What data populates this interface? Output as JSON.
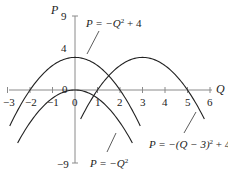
{
  "chart_data": {
    "type": "line",
    "title": "",
    "xlabel": "Q",
    "ylabel": "P",
    "xlim": [
      -3,
      6
    ],
    "ylim": [
      -9,
      9
    ],
    "x_ticks": [
      "-3",
      "-2",
      "-1",
      "0",
      "1",
      "2",
      "3",
      "4",
      "5",
      "6"
    ],
    "y_ticks": [
      "9",
      "4",
      "0",
      "-9"
    ],
    "grid": false,
    "legend": "none (curves labeled directly with annotations)",
    "series": [
      {
        "name": "P = -Q^2 + 4",
        "x": [
          -3,
          -2,
          -1,
          0,
          1,
          2,
          3
        ],
        "values": [
          -5,
          0,
          3,
          4,
          3,
          0,
          -5
        ]
      },
      {
        "name": "P = -Q^2",
        "x": [
          -3,
          -2,
          -1,
          0,
          1,
          2,
          3
        ],
        "values": [
          -9,
          -4,
          -1,
          0,
          -1,
          -4,
          -9
        ]
      },
      {
        "name": "P = -(Q - 3)^2 + 4",
        "x": [
          0,
          1,
          2,
          3,
          4,
          5,
          6
        ],
        "values": [
          -5,
          0,
          3,
          4,
          3,
          0,
          -5
        ]
      }
    ],
    "annotations": [
      {
        "text": "P = -Q² + 4",
        "points_to": "top of P = -Q^2 + 4 near Q≈0.5"
      },
      {
        "text": "P = -Q²",
        "points_to": "P = -Q^2 near Q≈1.5"
      },
      {
        "text": "P = -(Q - 3)² + 4",
        "points_to": "P = -(Q-3)^2 + 4 near Q≈5"
      }
    ]
  },
  "labels": {
    "axis_p": "P",
    "axis_q": "Q",
    "y_tick_9": "9",
    "y_tick_4": "4",
    "y_tick_0": "0",
    "y_tick_m9": "−9",
    "x_ticks": [
      "−3",
      "−2",
      "−1",
      "0",
      "1",
      "2",
      "3",
      "4",
      "5",
      "6"
    ],
    "eq1_main": "P = −Q",
    "eq1_sup": "2",
    "eq1_tail": " + 4",
    "eq2_main": "P = −Q",
    "eq2_sup": "2",
    "eq3_main": "P = −(Q − 3)",
    "eq3_sup": "2",
    "eq3_tail": "  + 4"
  }
}
